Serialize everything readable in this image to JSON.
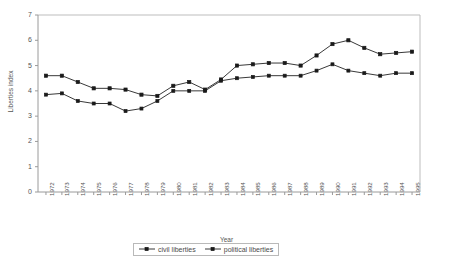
{
  "chart_data": {
    "type": "line",
    "title": "",
    "xlabel": "Year",
    "ylabel": "Liberties index",
    "ylim": [
      0,
      7
    ],
    "yticks": [
      0,
      1,
      2,
      3,
      4,
      5,
      6,
      7
    ],
    "grid": false,
    "legend_position": "bottom",
    "categories": [
      "1972",
      "1973",
      "1974",
      "1975",
      "1976",
      "1977",
      "1978",
      "1979",
      "1980",
      "1981",
      "1982",
      "1983",
      "1984",
      "1985",
      "1986",
      "1987",
      "1988",
      "1989",
      "1990",
      "1991",
      "1992",
      "1993",
      "1994",
      "1995"
    ],
    "series": [
      {
        "name": "civil liberties",
        "marker": "square-open",
        "values": [
          3.85,
          3.9,
          3.6,
          3.5,
          3.5,
          3.2,
          3.3,
          3.6,
          4.0,
          4.0,
          4.0,
          4.4,
          4.5,
          4.55,
          4.6,
          4.6,
          4.6,
          4.8,
          5.05,
          4.8,
          4.7,
          4.6,
          4.7,
          4.7
        ]
      },
      {
        "name": "political liberties",
        "marker": "square-filled",
        "values": [
          4.6,
          4.6,
          4.35,
          4.1,
          4.1,
          4.05,
          3.85,
          3.8,
          4.2,
          4.35,
          4.05,
          4.45,
          5.0,
          5.05,
          5.1,
          5.1,
          5.0,
          5.4,
          5.85,
          6.0,
          5.7,
          5.45,
          5.5,
          5.55
        ]
      }
    ]
  },
  "legend": {
    "entries": [
      {
        "label": "civil liberties"
      },
      {
        "label": "political liberties"
      }
    ]
  }
}
